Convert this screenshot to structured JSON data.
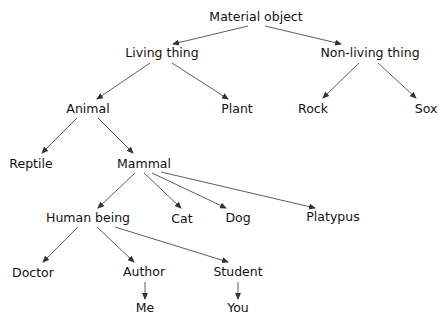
{
  "diagram": {
    "colors": {
      "text": "#111111",
      "edge": "#333333",
      "background": "#ffffff"
    },
    "nodes": [
      {
        "id": "material_object",
        "label": "Material object",
        "x": 256,
        "y": 17
      },
      {
        "id": "living_thing",
        "label": "Living thing",
        "x": 162,
        "y": 53
      },
      {
        "id": "non_living_thing",
        "label": "Non-living thing",
        "x": 370,
        "y": 53
      },
      {
        "id": "animal",
        "label": "Animal",
        "x": 88,
        "y": 109
      },
      {
        "id": "plant",
        "label": "Plant",
        "x": 237,
        "y": 109
      },
      {
        "id": "rock",
        "label": "Rock",
        "x": 313,
        "y": 109
      },
      {
        "id": "sox",
        "label": "Sox",
        "x": 426,
        "y": 109
      },
      {
        "id": "reptile",
        "label": "Reptile",
        "x": 31,
        "y": 164
      },
      {
        "id": "mammal",
        "label": "Mammal",
        "x": 144,
        "y": 164
      },
      {
        "id": "human_being",
        "label": "Human being",
        "x": 88,
        "y": 218
      },
      {
        "id": "cat",
        "label": "Cat",
        "x": 182,
        "y": 219
      },
      {
        "id": "dog",
        "label": "Dog",
        "x": 238,
        "y": 218
      },
      {
        "id": "platypus",
        "label": "Platypus",
        "x": 333,
        "y": 217
      },
      {
        "id": "doctor",
        "label": "Doctor",
        "x": 33,
        "y": 273
      },
      {
        "id": "author",
        "label": "Author",
        "x": 144,
        "y": 272
      },
      {
        "id": "student",
        "label": "Student",
        "x": 238,
        "y": 272
      },
      {
        "id": "me",
        "label": "Me",
        "x": 145,
        "y": 308
      },
      {
        "id": "you",
        "label": "You",
        "x": 238,
        "y": 308
      }
    ],
    "edges": [
      {
        "from": "material_object",
        "to": "living_thing",
        "x1": 248,
        "y1": 26,
        "x2": 173,
        "y2": 44
      },
      {
        "from": "material_object",
        "to": "non_living_thing",
        "x1": 265,
        "y1": 26,
        "x2": 341,
        "y2": 44
      },
      {
        "from": "living_thing",
        "to": "animal",
        "x1": 150,
        "y1": 63,
        "x2": 97,
        "y2": 99
      },
      {
        "from": "living_thing",
        "to": "plant",
        "x1": 172,
        "y1": 63,
        "x2": 228,
        "y2": 99
      },
      {
        "from": "non_living_thing",
        "to": "rock",
        "x1": 359,
        "y1": 63,
        "x2": 323,
        "y2": 98
      },
      {
        "from": "non_living_thing",
        "to": "sox",
        "x1": 378,
        "y1": 63,
        "x2": 416,
        "y2": 98
      },
      {
        "from": "animal",
        "to": "reptile",
        "x1": 77,
        "y1": 118,
        "x2": 42,
        "y2": 153
      },
      {
        "from": "animal",
        "to": "mammal",
        "x1": 98,
        "y1": 118,
        "x2": 133,
        "y2": 153
      },
      {
        "from": "mammal",
        "to": "human_being",
        "x1": 135,
        "y1": 173,
        "x2": 98,
        "y2": 208
      },
      {
        "from": "mammal",
        "to": "cat",
        "x1": 144,
        "y1": 173,
        "x2": 181,
        "y2": 208
      },
      {
        "from": "mammal",
        "to": "dog",
        "x1": 152,
        "y1": 173,
        "x2": 226,
        "y2": 208
      },
      {
        "from": "mammal",
        "to": "platypus",
        "x1": 161,
        "y1": 172,
        "x2": 315,
        "y2": 208
      },
      {
        "from": "human_being",
        "to": "doctor",
        "x1": 78,
        "y1": 227,
        "x2": 43,
        "y2": 262
      },
      {
        "from": "human_being",
        "to": "author",
        "x1": 97,
        "y1": 227,
        "x2": 134,
        "y2": 262
      },
      {
        "from": "human_being",
        "to": "student",
        "x1": 115,
        "y1": 227,
        "x2": 228,
        "y2": 262
      },
      {
        "from": "author",
        "to": "me",
        "x1": 145,
        "y1": 282,
        "x2": 145,
        "y2": 299
      },
      {
        "from": "student",
        "to": "you",
        "x1": 238,
        "y1": 282,
        "x2": 238,
        "y2": 299
      }
    ]
  }
}
